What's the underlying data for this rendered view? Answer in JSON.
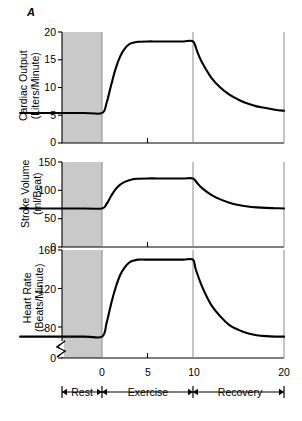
{
  "figure": {
    "panel_letter": "A",
    "phases": [
      {
        "name": "Rest",
        "start_min": -9,
        "end_min": 0
      },
      {
        "name": "Exercise",
        "start_min": 0,
        "end_min": 10
      },
      {
        "name": "Recovery",
        "start_min": 10,
        "end_min": 20
      }
    ],
    "x_axis": {
      "label": "",
      "ticks": [
        "0",
        "5",
        "10",
        "20"
      ],
      "tick_values": [
        0,
        5,
        10,
        20
      ],
      "range": [
        -9,
        20
      ],
      "unit": "minutes"
    }
  },
  "chart_data": [
    {
      "type": "line",
      "title": "Cardiac Output",
      "ylabel": "Cardiac Output\n(Liters/Minute)",
      "ylabel_line1": "Cardiac Output",
      "ylabel_line2": "(Liters/Minute)",
      "xlabel": "",
      "ylim": [
        0,
        20
      ],
      "yticks": [
        0,
        5,
        10,
        15,
        20
      ],
      "ytick_labels": [
        "0",
        "5",
        "10",
        "15",
        "20"
      ],
      "xlim": [
        -9,
        20
      ],
      "grid": false,
      "axis_break": false,
      "rest_value": 5.4,
      "exercise_plateau": 18.3,
      "recovery_end_value": 5.8,
      "x": [
        -9,
        -2,
        0,
        0.5,
        1,
        1.5,
        2,
        2.5,
        3,
        3.5,
        4,
        5,
        6,
        7,
        8,
        9,
        10,
        10.5,
        11,
        12,
        13,
        14,
        15,
        16,
        17,
        18,
        19,
        20
      ],
      "y": [
        5.4,
        5.4,
        5.4,
        7.2,
        10.4,
        13.4,
        15.6,
        17.0,
        17.8,
        18.1,
        18.25,
        18.3,
        18.3,
        18.3,
        18.3,
        18.3,
        18.3,
        16.3,
        14.5,
        11.8,
        10.0,
        8.7,
        7.8,
        7.1,
        6.6,
        6.3,
        6.0,
        5.8
      ]
    },
    {
      "type": "line",
      "title": "Stroke Volume",
      "ylabel": "Stroke Volume\n(ml/Beat)",
      "ylabel_line1": "Stroke Volume",
      "ylabel_line2": "(ml/Beat)",
      "xlabel": "",
      "ylim": [
        0,
        150
      ],
      "yticks": [
        0,
        50,
        100,
        150
      ],
      "ytick_labels": [
        "0",
        "50",
        "100",
        "150"
      ],
      "xlim": [
        -9,
        20
      ],
      "grid": false,
      "axis_break": false,
      "rest_value": 68,
      "exercise_plateau": 121,
      "recovery_end_value": 68,
      "x": [
        -9,
        -2,
        0,
        0.5,
        1,
        1.5,
        2,
        2.5,
        3,
        3.5,
        4,
        5,
        6,
        7,
        8,
        9,
        10,
        10.5,
        11,
        12,
        13,
        14,
        15,
        16,
        17,
        18,
        19,
        20
      ],
      "y": [
        68,
        68,
        68,
        76,
        90,
        102,
        110,
        115,
        118,
        120,
        120.5,
        121,
        121,
        121,
        121,
        121,
        121,
        112,
        104,
        92,
        84,
        78,
        74,
        71.5,
        70,
        69,
        68.5,
        68
      ]
    },
    {
      "type": "line",
      "title": "Heart Rate",
      "ylabel": "Heart Rate\n(Beats/Minute)",
      "ylabel_line1": "Heart Rate",
      "ylabel_line2": "(Beats/Minute)",
      "xlabel": "",
      "ylim": [
        0,
        160
      ],
      "yticks": [
        0,
        80,
        120,
        160
      ],
      "ytick_labels": [
        "0",
        "80",
        "120",
        "160"
      ],
      "xlim": [
        -9,
        20
      ],
      "grid": false,
      "axis_break": true,
      "axis_break_note": "break symbol on y-axis between 0 and 80",
      "rest_value": 70,
      "exercise_plateau": 150,
      "recovery_end_value": 70,
      "x": [
        -9,
        -2,
        0,
        0.5,
        1,
        1.5,
        2,
        2.5,
        3,
        3.5,
        4,
        5,
        6,
        7,
        8,
        9,
        10,
        10.3,
        11,
        12,
        13,
        14,
        15,
        16,
        17,
        18,
        19,
        20
      ],
      "y": [
        70,
        70,
        70,
        84,
        104,
        121,
        134,
        142,
        147,
        149,
        150,
        150,
        150,
        150,
        150,
        150,
        150,
        140,
        122,
        103,
        91,
        82,
        77,
        73.5,
        71.5,
        70.5,
        70,
        70
      ]
    }
  ],
  "colors": {
    "curve": "#000000",
    "rest_shading": "#c9c9c9",
    "axis": "#000000",
    "divider": "#8a8a8a",
    "background": "#ffffff"
  }
}
